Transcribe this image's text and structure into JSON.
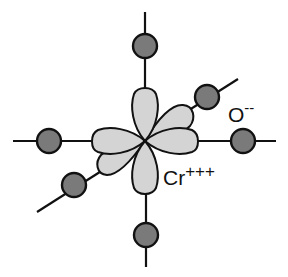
{
  "diagram": {
    "title": "",
    "colors": {
      "lobe_fill": "#d4d4d4",
      "ion_fill": "#7a7a7a",
      "stroke": "#111111",
      "background": "#ffffff"
    },
    "central_ion": {
      "label": "Cr",
      "charge": "+++",
      "orbital_lobes": 6
    },
    "ligand_ion": {
      "label": "O",
      "charge": "--",
      "count": 6
    },
    "nodes": [
      {
        "name": "oxygen-top"
      },
      {
        "name": "oxygen-bottom"
      },
      {
        "name": "oxygen-left"
      },
      {
        "name": "oxygen-right"
      },
      {
        "name": "oxygen-front-upper-right"
      },
      {
        "name": "oxygen-back-lower-left"
      }
    ]
  }
}
